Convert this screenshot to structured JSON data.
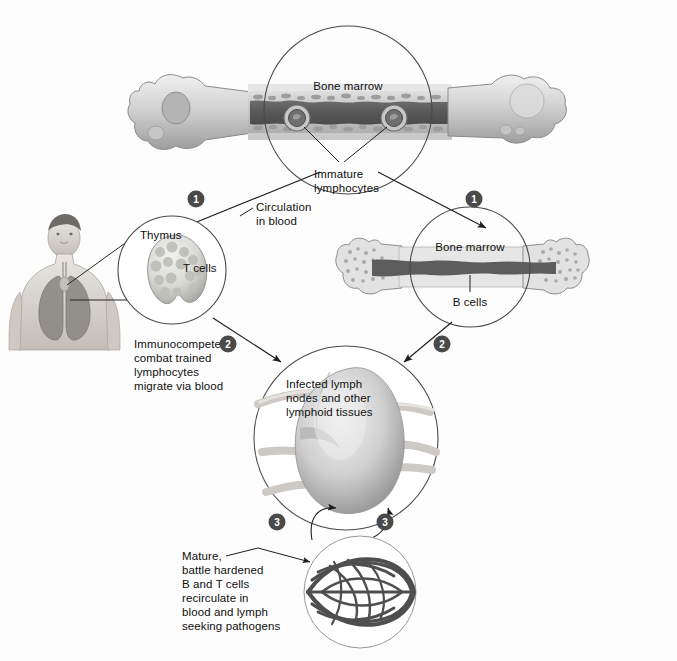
{
  "figure": {
    "background_color": "#fdfdfd",
    "ink_color": "#101010"
  },
  "labels": {
    "bone_marrow_top": "Bone marrow",
    "immature_lymphocytes": "Immature\nlymphocytes",
    "immature_lymphocytes_line1": "Immature",
    "immature_lymphocytes_line2": "lymphocytes",
    "circulation_in_blood_line1": "Circulation",
    "circulation_in_blood_line2": "in blood",
    "thymus": "Thymus",
    "t_cells": "T cells",
    "bone_marrow_right": "Bone marrow",
    "b_cells": "B cells",
    "immunocompetent_line1": "Immunocompetent,",
    "immunocompetent_line2": "combat trained",
    "immunocompetent_line3": "lymphocytes",
    "immunocompetent_line4": "migrate via blood",
    "infected_lymph_line1": "Infected lymph",
    "infected_lymph_line2": "nodes and other",
    "infected_lymph_line3": "lymphoid tissues",
    "mature_line1": "Mature,",
    "mature_line2": "battle hardened",
    "mature_line3": "B and T cells",
    "mature_line4": "recirculate in",
    "mature_line5": "blood and lymph",
    "mature_line6": "seeking pathogens"
  },
  "steps": [
    {
      "id": "step-1-left",
      "number": "1",
      "x": 196,
      "y": 199
    },
    {
      "id": "step-1-right",
      "number": "1",
      "x": 474,
      "y": 199
    },
    {
      "id": "step-2-left",
      "number": "2",
      "x": 228,
      "y": 344
    },
    {
      "id": "step-2-right",
      "number": "2",
      "x": 442,
      "y": 344
    },
    {
      "id": "step-3-left",
      "number": "3",
      "x": 277,
      "y": 522
    },
    {
      "id": "step-3-right",
      "number": "3",
      "x": 385,
      "y": 522
    }
  ],
  "structures": [
    {
      "id": "femur-top",
      "name": "Bone with red marrow (source of immature lymphocytes)"
    },
    {
      "id": "thymus-circle",
      "name": "Thymus where T cells mature"
    },
    {
      "id": "bone-right",
      "name": "Bone marrow where B cells mature"
    },
    {
      "id": "lymph-node",
      "name": "Infected lymph node and lymphoid tissue"
    },
    {
      "id": "vessel-network",
      "name": "Blood and lymph vessel network"
    },
    {
      "id": "human-figure",
      "name": "Human torso showing thymus and lungs"
    }
  ],
  "colors": {
    "marrow_dark": "#5d5d5d",
    "bone_light": "#dcdcdc",
    "bone_mid": "#b9b9b9",
    "outline": "#3a3a3a",
    "badge_fill": "#4a4a4a",
    "tissue_light": "#e3e3e3"
  }
}
